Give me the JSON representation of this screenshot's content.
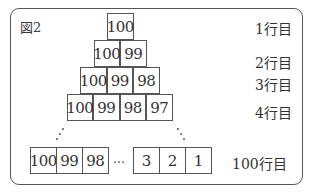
{
  "figure": {
    "label": "図2",
    "rows": [
      {
        "label": "1行目",
        "cells": [
          "100"
        ]
      },
      {
        "label": "2行目",
        "cells": [
          "100",
          "99"
        ]
      },
      {
        "label": "3行目",
        "cells": [
          "100",
          "99",
          "98"
        ]
      },
      {
        "label": "4行目",
        "cells": [
          "100",
          "99",
          "98",
          "97"
        ]
      },
      {
        "label": "100行目",
        "cells_left": [
          "100",
          "99",
          "98"
        ],
        "ellipsis": "…",
        "cells_right": [
          "3",
          "2",
          "1"
        ]
      }
    ]
  }
}
